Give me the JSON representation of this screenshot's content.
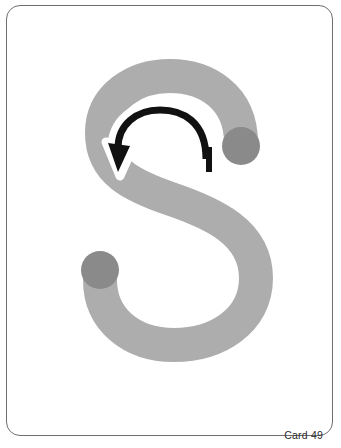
{
  "card": {
    "label": "Card 49",
    "letter": "S",
    "letter_case": "uppercase",
    "background_color": "#ffffff",
    "border_color": "#6e6e72",
    "stroke_color": "#adadad",
    "dot_color": "#8a8a8a",
    "arrow_color": "#111111",
    "arrow_halo_color": "#ffffff",
    "label_color": "#2b2b2b"
  },
  "strokes": {
    "letter_stroke_width": 34,
    "start_dot_label": "start-dot",
    "end_dot_label": "end-dot",
    "start_dot_position": "top-right",
    "end_dot_position": "bottom-left",
    "direction_arrow_label": "counterclockwise-direction-arrow",
    "tick_label": "stroke-start-tick"
  },
  "geometry": {
    "letter_path": "M 241 143 C 241 96 205 76 170 76 C 134 76 102 97 102 133 C 102 172 133 186 171 199 C 212 213 256 232 256 278 C 256 321 217 345 174 345 C 131 345 100 319 100 280",
    "arrow_path": "M 206 159 C 206 121 182 110 160 110 C 136 110 118 125 118 148",
    "arrow_head": "M 118 172 L 108 143 L 130 146 Z",
    "tick_x1": 209,
    "tick_y1": 147,
    "tick_x2": 209,
    "tick_y2": 172,
    "start_dot_cx": 241,
    "start_dot_cy": 146,
    "start_dot_r": 19,
    "end_dot_cx": 100,
    "end_dot_cy": 270,
    "end_dot_r": 19
  }
}
